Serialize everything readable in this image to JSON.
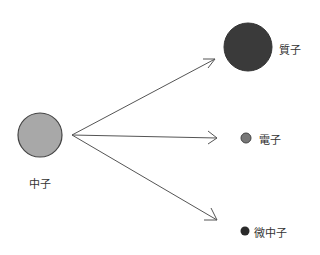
{
  "diagram": {
    "source": {
      "label": "中子",
      "color": "#a8a8a8"
    },
    "products": [
      {
        "label": "質子",
        "color": "#3a3a3a"
      },
      {
        "label": "電子",
        "color": "#777777"
      },
      {
        "label": "微中子",
        "color": "#2a2a2a"
      }
    ]
  }
}
